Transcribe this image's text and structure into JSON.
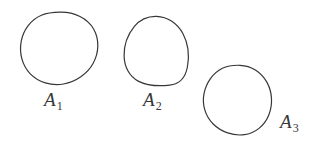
{
  "figure": {
    "type": "set-diagram",
    "background_color": "#ffffff",
    "stroke_color": "#37373a",
    "stroke_width": 1.2,
    "regions": [
      {
        "id": "A1",
        "label_base": "A",
        "label_subscript": "1",
        "shape": "oval",
        "bounds": {
          "x": 22,
          "y": 12,
          "width": 76,
          "height": 73
        },
        "label_position": {
          "x": 44,
          "y": 90
        }
      },
      {
        "id": "A2",
        "label_base": "A",
        "label_subscript": "2",
        "shape": "egg",
        "bounds": {
          "x": 124,
          "y": 16,
          "width": 64,
          "height": 69
        },
        "label_position": {
          "x": 143,
          "y": 90
        }
      },
      {
        "id": "A3",
        "label_base": "A",
        "label_subscript": "3",
        "shape": "teardrop",
        "bounds": {
          "x": 204,
          "y": 65,
          "width": 68,
          "height": 70
        },
        "label_position": {
          "x": 280,
          "y": 112
        }
      }
    ]
  }
}
